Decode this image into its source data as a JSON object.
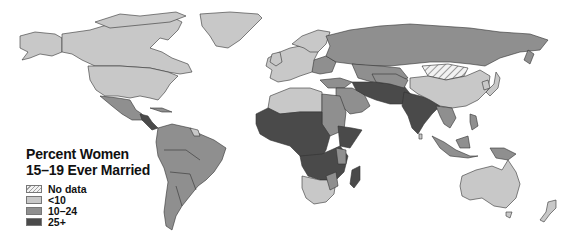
{
  "legend": {
    "title_line1": "Percent Women",
    "title_line2": "15–19 Ever Married",
    "items": [
      {
        "label": "No data",
        "pattern": "hatched",
        "color": "#e6e6e6"
      },
      {
        "label": "<10",
        "color": "#c8c8c8"
      },
      {
        "label": "10–24",
        "color": "#8f8f8f"
      },
      {
        "label": "25+",
        "color": "#4a4a4a"
      }
    ]
  },
  "colors": {
    "no_data": "#e6e6e6",
    "low": "#c8c8c8",
    "mid": "#8f8f8f",
    "high": "#4a4a4a",
    "water": "#ffffff",
    "border": "#333333"
  },
  "regions": [
    {
      "name": "North America (Canada, USA, Alaska)",
      "category": "<10"
    },
    {
      "name": "Greenland",
      "category": "<10"
    },
    {
      "name": "Mexico & Central America",
      "category": "10–24"
    },
    {
      "name": "Central America (Guatemala, Honduras, Nicaragua)",
      "category": "25+"
    },
    {
      "name": "South America",
      "category": "10–24"
    },
    {
      "name": "Western Europe",
      "category": "<10"
    },
    {
      "name": "Eastern Europe & Russia",
      "category": "10–24"
    },
    {
      "name": "North Africa",
      "category": "<10"
    },
    {
      "name": "Egypt & Sudan",
      "category": "10–24"
    },
    {
      "name": "West & Central Africa",
      "category": "25+"
    },
    {
      "name": "East Africa",
      "category": "25+"
    },
    {
      "name": "Southern Africa",
      "category": "<10"
    },
    {
      "name": "Madagascar",
      "category": "25+"
    },
    {
      "name": "Middle East",
      "category": "10–24"
    },
    {
      "name": "Afghanistan, Pakistan, Iran region",
      "category": "25+"
    },
    {
      "name": "India & Bangladesh",
      "category": "25+"
    },
    {
      "name": "Mongolia",
      "category": "No data"
    },
    {
      "name": "China",
      "category": "<10"
    },
    {
      "name": "Japan & Korea",
      "category": "<10"
    },
    {
      "name": "Southeast Asia",
      "category": "10–24"
    },
    {
      "name": "Indonesia & Papua",
      "category": "10–24"
    },
    {
      "name": "Australia",
      "category": "<10"
    },
    {
      "name": "New Zealand",
      "category": "<10"
    }
  ]
}
